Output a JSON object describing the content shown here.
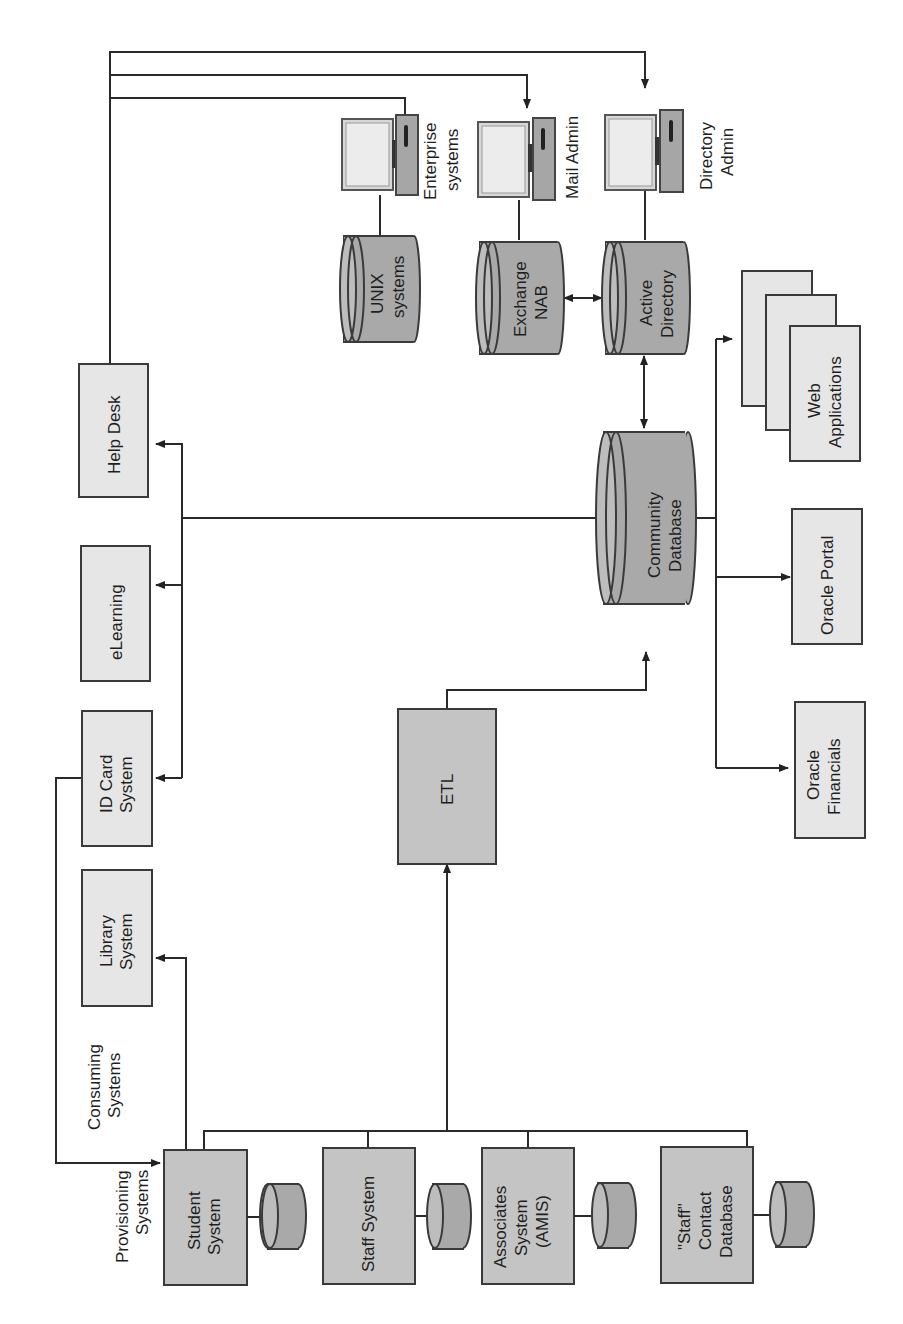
{
  "diagram": {
    "orientation": "rotated 90 degrees counter-clockwise",
    "group_labels": {
      "provisioning": [
        "Provisioning",
        "Systems"
      ],
      "consuming": [
        "Consuming",
        "Systems"
      ]
    },
    "provisioning_systems": [
      {
        "id": "student",
        "lines": [
          "Student",
          "System"
        ]
      },
      {
        "id": "staff",
        "lines": [
          "Staff System"
        ]
      },
      {
        "id": "associates",
        "lines": [
          "Associates",
          "System",
          "(AMIS)"
        ]
      },
      {
        "id": "staff-contact",
        "lines": [
          "\"Staff\"",
          "Contact",
          "Database"
        ]
      }
    ],
    "consuming_systems": [
      {
        "id": "library",
        "lines": [
          "Library",
          "System"
        ]
      },
      {
        "id": "id-card",
        "lines": [
          "ID Card",
          "System"
        ]
      },
      {
        "id": "elearning",
        "lines": [
          "eLearning"
        ]
      },
      {
        "id": "help-desk",
        "lines": [
          "Help Desk"
        ]
      }
    ],
    "etl": {
      "label": "ETL"
    },
    "community_db": {
      "lines": [
        "Community",
        "Database"
      ]
    },
    "directory_stores": [
      {
        "id": "unix",
        "lines": [
          "UNIX",
          "systems"
        ]
      },
      {
        "id": "exchange",
        "lines": [
          "Exchange",
          "NAB"
        ]
      },
      {
        "id": "active-directory",
        "lines": [
          "Active",
          "Directory"
        ]
      }
    ],
    "admin_consoles": [
      {
        "id": "enterprise",
        "lines": [
          "Enterprise",
          "systems"
        ]
      },
      {
        "id": "mail-admin",
        "lines": [
          "Mail Admin"
        ]
      },
      {
        "id": "directory-admin",
        "lines": [
          "Directory",
          "Admin"
        ]
      }
    ],
    "downstream_apps": [
      {
        "id": "oracle-financials",
        "lines": [
          "Oracle",
          "Financials"
        ]
      },
      {
        "id": "oracle-portal",
        "lines": [
          "Oracle Portal"
        ]
      },
      {
        "id": "web-apps",
        "lines": [
          "Web",
          "Applications"
        ]
      }
    ],
    "colors": {
      "dark_box": "#c4c4c4",
      "light_box": "#e6e6e6",
      "cylinder": "#a9a9a9",
      "stroke": "#3a3a3a"
    }
  }
}
